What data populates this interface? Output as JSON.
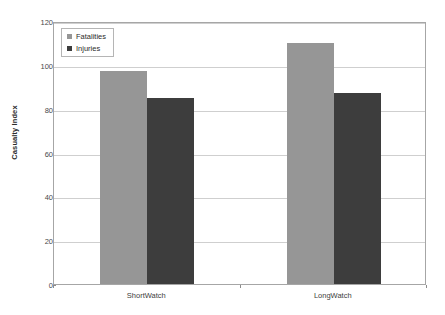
{
  "chart_data": {
    "type": "bar",
    "title": "",
    "subtitle": "",
    "xlabel": "",
    "ylabel": "Casualty Index",
    "categories": [
      "ShortWatch",
      "LongWatch"
    ],
    "series": [
      {
        "name": "Fatalities",
        "values": [
          97,
          110
        ],
        "color": "#969696"
      },
      {
        "name": "Injuries",
        "values": [
          85,
          87
        ],
        "color": "#3d3d3d"
      }
    ],
    "ylim": [
      0,
      120
    ],
    "ytick_step": 20,
    "yticks": [
      0,
      20,
      40,
      60,
      80,
      100,
      120
    ],
    "ytick_labels": [
      "0",
      "20",
      "40",
      "60",
      "80",
      "100",
      "120"
    ],
    "grid": true,
    "grid_axis": "y",
    "legend": {
      "position": "top-left",
      "border": true
    },
    "plot_background": "#ffffff",
    "frame_color": "#a6a6a6",
    "gridline_color": "#cfcfcf"
  }
}
